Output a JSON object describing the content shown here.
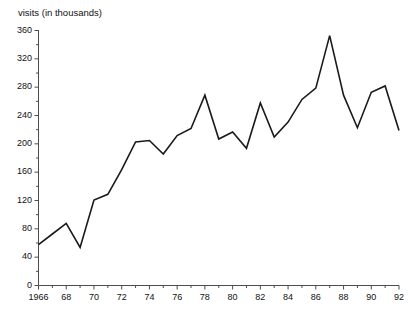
{
  "chart_data": {
    "type": "line",
    "title": "visits (in thousands)",
    "xlabel": "",
    "ylabel": "visits (in thousands)",
    "grid": false,
    "legend": "none",
    "xlim": [
      1966,
      1992
    ],
    "ylim": [
      0,
      360
    ],
    "y_ticks_major": [
      0,
      40,
      80,
      120,
      160,
      200,
      240,
      280,
      320,
      360
    ],
    "y_tick_labels": [
      "0",
      "40",
      "80",
      "120",
      "160",
      "200",
      "240",
      "280",
      "320",
      "360"
    ],
    "y_minor_tick_step": 20,
    "x_ticks_major": [
      1966,
      1968,
      1970,
      1972,
      1974,
      1976,
      1978,
      1980,
      1982,
      1984,
      1986,
      1988,
      1990,
      1992
    ],
    "x_tick_labels": [
      "1966",
      "68",
      "70",
      "72",
      "74",
      "76",
      "78",
      "80",
      "82",
      "84",
      "86",
      "88",
      "90",
      "92"
    ],
    "x_minor_tick_step": 1,
    "series": [
      {
        "name": "visits",
        "color": "#1a1a1a",
        "x": [
          1966,
          1967,
          1968,
          1969,
          1970,
          1971,
          1972,
          1973,
          1974,
          1975,
          1976,
          1977,
          1978,
          1979,
          1980,
          1981,
          1982,
          1983,
          1984,
          1985,
          1986,
          1987,
          1988,
          1989,
          1990,
          1991,
          1992
        ],
        "values": [
          57,
          72,
          87,
          53,
          120,
          128,
          163,
          202,
          204,
          185,
          211,
          221,
          268,
          206,
          216,
          193,
          257,
          209,
          230,
          262,
          278,
          352,
          268,
          222,
          272,
          281,
          218
        ]
      }
    ]
  },
  "axes": {
    "line_color": "#4d4d4d",
    "tick_color": "#4d4d4d"
  }
}
